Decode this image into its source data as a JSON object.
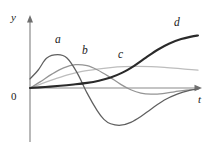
{
  "figure": {
    "background_color": "#ffffff",
    "width": 209,
    "height": 146
  },
  "axes": {
    "y_axis_label": "y",
    "x_axis_label": "t",
    "origin_label": "0",
    "axis_color": "#8a8a8a",
    "y_axis_x_px": 30,
    "x_axis_y_px": 88,
    "y_axis_top_px": 16,
    "y_axis_bottom_px": 142,
    "x_axis_right_px": 201
  },
  "curve_labels": {
    "a": "a",
    "b": "b",
    "c": "c",
    "d": "d"
  },
  "colors": {
    "curve_a": "#5f5f5f",
    "curve_b": "#949494",
    "curve_c": "#bdbdbd",
    "curve_d": "#2a2a2a",
    "axis": "#8a8a8a",
    "text": "#1a1a1a"
  },
  "chart_data": {
    "type": "line",
    "title": "",
    "xlabel": "t",
    "ylabel": "y",
    "grid": false,
    "legend": "inline-curve-labels",
    "xlim": [
      0,
      10
    ],
    "ylim": [
      -2.6,
      3.9
    ],
    "axis_ticks": {
      "x": [],
      "y": []
    },
    "annotations": [
      {
        "text": "a",
        "x": 1.65,
        "y": 2.55,
        "curve": "a"
      },
      {
        "text": "b",
        "x": 3.27,
        "y": 2.02,
        "curve": "b"
      },
      {
        "text": "c",
        "x": 5.24,
        "y": 1.7,
        "curve": "c"
      },
      {
        "text": "d",
        "x": 8.47,
        "y": 3.45,
        "curve": "d"
      },
      {
        "text": "0",
        "x": 0,
        "y": 0,
        "curve": "origin"
      },
      {
        "text": "y",
        "x": 0,
        "y": 3.75,
        "curve": "axis"
      },
      {
        "text": "t",
        "x": 10.0,
        "y": -0.38,
        "curve": "axis"
      }
    ],
    "series": [
      {
        "name": "a",
        "label": "a",
        "color": "#5f5f5f",
        "description": "damped oscillation: starts positive, peaks early, crosses zero, deep negative trough, returns toward zero",
        "x": [
          0.0,
          0.5,
          1.0,
          1.65,
          2.2,
          2.8,
          3.4,
          4.0,
          4.4,
          4.8,
          5.4,
          6.0,
          6.6,
          7.2,
          8.0,
          8.8,
          9.5,
          10.0
        ],
        "y": [
          0.62,
          1.25,
          2.05,
          2.28,
          2.05,
          1.05,
          -0.35,
          -1.55,
          -2.15,
          -2.45,
          -2.55,
          -2.35,
          -1.95,
          -1.45,
          -0.82,
          -0.4,
          -0.16,
          -0.06
        ]
      },
      {
        "name": "b",
        "label": "b",
        "color": "#949494",
        "description": "starts at origin, broad positive hump, crosses zero, shallow negative dip, returns toward zero",
        "x": [
          0.0,
          0.6,
          1.3,
          2.0,
          2.7,
          3.4,
          4.0,
          4.7,
          5.4,
          6.0,
          6.6,
          7.2,
          7.9,
          8.6,
          9.3,
          10.0
        ],
        "y": [
          0.0,
          0.42,
          0.95,
          1.38,
          1.6,
          1.53,
          1.25,
          0.78,
          0.25,
          -0.12,
          -0.35,
          -0.42,
          -0.38,
          -0.26,
          -0.14,
          -0.08
        ]
      },
      {
        "name": "c",
        "label": "c",
        "color": "#bdbdbd",
        "description": "starts at origin, monotone rise that flattens into a long gentle plateau",
        "x": [
          0.0,
          0.7,
          1.5,
          2.3,
          3.1,
          4.0,
          4.8,
          5.6,
          6.4,
          7.2,
          8.0,
          8.8,
          9.4,
          10.0
        ],
        "y": [
          0.0,
          0.3,
          0.62,
          0.92,
          1.14,
          1.3,
          1.4,
          1.46,
          1.48,
          1.46,
          1.41,
          1.34,
          1.28,
          1.22
        ]
      },
      {
        "name": "d",
        "label": "d",
        "color": "#2a2a2a",
        "description": "starts at origin, nearly flat at first, then accelerating sigmoid-like climb to the top right",
        "x": [
          0.0,
          0.9,
          1.8,
          2.6,
          3.4,
          4.1,
          4.8,
          5.5,
          6.2,
          6.9,
          7.6,
          8.3,
          9.0,
          9.6,
          10.0
        ],
        "y": [
          0.0,
          0.07,
          0.15,
          0.24,
          0.35,
          0.5,
          0.72,
          1.05,
          1.52,
          2.08,
          2.62,
          3.05,
          3.35,
          3.52,
          3.6
        ]
      }
    ]
  }
}
